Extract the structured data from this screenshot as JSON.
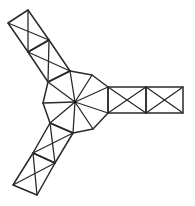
{
  "diagram": {
    "type": "truss-frame-three-arm",
    "stroke_color": "#2a2a2a",
    "background": "#ffffff",
    "hub": {
      "center": [
        75,
        102
      ],
      "vertices": [
        [
          43,
          103
        ],
        [
          48,
          82
        ],
        [
          70,
          71
        ],
        [
          92,
          75
        ],
        [
          108,
          87
        ],
        [
          108,
          113
        ],
        [
          93,
          129
        ],
        [
          73,
          133
        ],
        [
          50,
          123
        ]
      ]
    },
    "arms": [
      {
        "name": "upper-left-arm",
        "panels": [
          [
            [
              8,
              23
            ],
            [
              28,
              10
            ],
            [
              49,
              40
            ],
            [
              28,
              52
            ]
          ],
          [
            [
              28,
              52
            ],
            [
              49,
              40
            ],
            [
              70,
              71
            ],
            [
              48,
              82
            ]
          ]
        ]
      },
      {
        "name": "right-arm",
        "panels": [
          [
            [
              108,
              87
            ],
            [
              146,
              87
            ],
            [
              146,
              113
            ],
            [
              108,
              113
            ]
          ],
          [
            [
              146,
              87
            ],
            [
              183,
              87
            ],
            [
              183,
              113
            ],
            [
              146,
              113
            ]
          ]
        ]
      },
      {
        "name": "lower-left-arm",
        "panels": [
          [
            [
              50,
              123
            ],
            [
              73,
              133
            ],
            [
              55,
              163
            ],
            [
              33,
              153
            ]
          ],
          [
            [
              33,
              153
            ],
            [
              55,
              163
            ],
            [
              37,
              195
            ],
            [
              13,
              185
            ]
          ]
        ]
      }
    ]
  }
}
